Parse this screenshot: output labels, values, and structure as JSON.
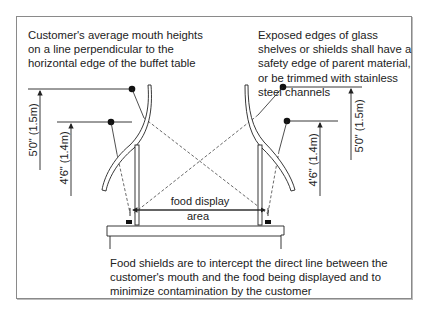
{
  "diagram": {
    "notes": {
      "mouth_heights": "Customer's average mouth heights on a line perpendicular to the horizontal edge of the buffet table",
      "glass_edges": "Exposed edges of glass shelves or shields shall have a safety edge of parent material, or be trimmed with stainless steel channels",
      "purpose": "Food shields are to intercept the direct line between the customer's mouth and the food being displayed and to minimize contamination by the customer"
    },
    "dimensions": {
      "left_high": "5'0\" (1.5m)",
      "left_low": "4'6\" (1.4m)",
      "right_high": "5'0\" (1.5m)",
      "right_low": "4'6\" (1.4m)"
    },
    "area_label_line1": "food display",
    "area_label_line2": "area"
  }
}
